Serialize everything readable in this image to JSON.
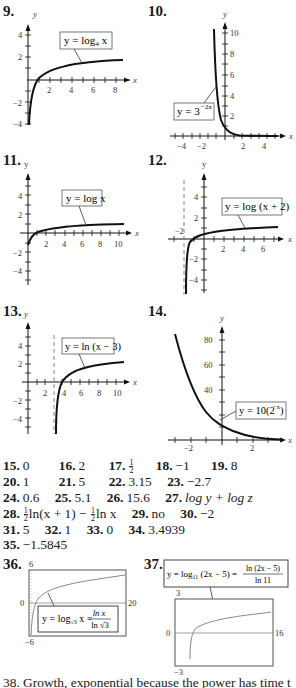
{
  "graphs": [
    {
      "number": "9.",
      "label": "y = log₄ x",
      "x_ticks": [
        "2",
        "4",
        "6",
        "8"
      ],
      "y_ticks": [
        "4",
        "2",
        "−2",
        "−4"
      ],
      "x_axis": "x",
      "y_axis": "y"
    },
    {
      "number": "10.",
      "label": "y = 3^(−2x)",
      "label_base": "y = 3",
      "label_exp": "−2x",
      "x_ticks": [
        "−4",
        "−2",
        "2",
        "4"
      ],
      "y_ticks": [
        "10",
        "8",
        "6",
        "4",
        "2"
      ],
      "x_axis": "x",
      "y_axis": "y"
    },
    {
      "number": "11.",
      "label": "y = log x",
      "x_ticks": [
        "2",
        "4",
        "6",
        "8",
        "10"
      ],
      "y_ticks": [
        "4",
        "2",
        "−2",
        "−4"
      ],
      "x_axis": "x",
      "y_axis": "y"
    },
    {
      "number": "12.",
      "label": "y = log (x + 2)",
      "x_ticks": [
        "2",
        "4",
        "6"
      ],
      "y_ticks": [
        "4",
        "2",
        "−2",
        "−4"
      ],
      "asymptote_label": "−2",
      "x_axis": "x",
      "y_axis": "y"
    },
    {
      "number": "13.",
      "label": "y = ln (x − 3)",
      "x_ticks": [
        "2",
        "4",
        "6",
        "8",
        "10"
      ],
      "y_ticks": [
        "4",
        "2",
        "−2",
        "−4"
      ],
      "x_axis": "x",
      "y_axis": "y"
    },
    {
      "number": "14.",
      "label": "y = 10(2^(−x))",
      "label_base": "y = 10(2",
      "label_exp": "−x",
      "label_close": ")",
      "x_ticks": [
        "−2",
        "2"
      ],
      "y_ticks": [
        "80",
        "60",
        "40"
      ],
      "x_axis": "x",
      "y_axis": "y"
    },
    {
      "number": "36.",
      "label": "y = log√3 x = ln x / ln √3",
      "window": {
        "ymax": "6",
        "ymin": "−6",
        "xmin": "0",
        "xmax": "20"
      }
    },
    {
      "number": "37.",
      "label": "y = log₁₁ (2x − 5) = ln (2x − 5) / ln 11",
      "window": {
        "ymax": "3",
        "ymin": "−3",
        "xmin": "0",
        "xmax": "16"
      }
    }
  ],
  "answers": {
    "a15": {
      "n": "15.",
      "v": "0"
    },
    "a16": {
      "n": "16.",
      "v": "2"
    },
    "a17": {
      "n": "17.",
      "num": "1",
      "den": "2"
    },
    "a18": {
      "n": "18.",
      "v": "−1"
    },
    "a19": {
      "n": "19.",
      "v": "8"
    },
    "a20": {
      "n": "20.",
      "v": "1"
    },
    "a21": {
      "n": "21.",
      "v": "5"
    },
    "a22": {
      "n": "22.",
      "v": "3.15"
    },
    "a23": {
      "n": "23.",
      "v": "−2.7"
    },
    "a24": {
      "n": "24.",
      "v": "0.6"
    },
    "a25": {
      "n": "25.",
      "v": "5.1"
    },
    "a26": {
      "n": "26.",
      "v": "15.6"
    },
    "a27": {
      "n": "27.",
      "v": "log y + log z"
    },
    "a28": {
      "n": "28.",
      "frac_num": "1",
      "frac_den": "2",
      "part1": "ln(x + 1) −",
      "part2": "ln x"
    },
    "a29": {
      "n": "29.",
      "v": "no"
    },
    "a30": {
      "n": "30.",
      "v": "−2"
    },
    "a31": {
      "n": "31.",
      "v": "5"
    },
    "a32": {
      "n": "32.",
      "v": "1"
    },
    "a33": {
      "n": "33.",
      "v": "0"
    },
    "a34": {
      "n": "34.",
      "v": "3.4939"
    },
    "a35": {
      "n": "35.",
      "v": "−1.5845"
    }
  },
  "bottom_text": "38.  Growth, exponential because the power has time t"
}
